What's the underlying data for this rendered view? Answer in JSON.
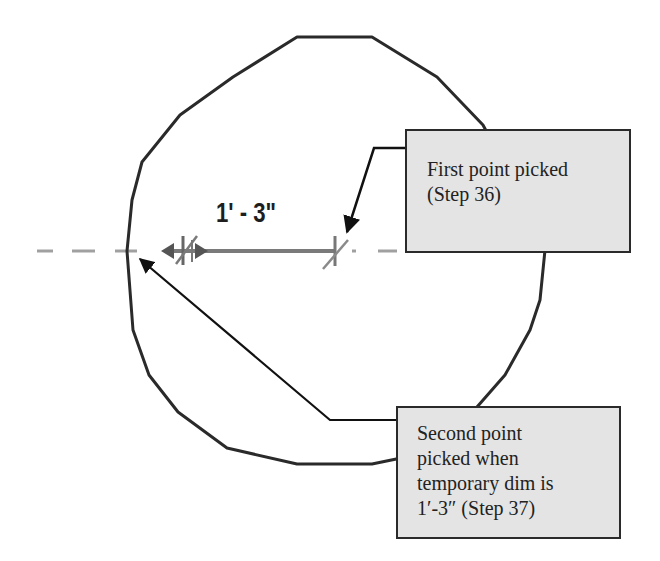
{
  "diagram": {
    "dimension_label": "1' - 3\"",
    "callouts": {
      "first": {
        "lines": [
          "First point picked",
          "(Step 36)"
        ]
      },
      "second": {
        "lines": [
          "Second point",
          "picked when",
          "temporary dim is",
          "1′-3″ (Step 37)"
        ]
      }
    },
    "colors": {
      "outline": "#2a2a2a",
      "callout_fill": "#e4e4e4",
      "centerline": "#9a9a9a",
      "dimension_line": "#7a7a7a"
    }
  }
}
